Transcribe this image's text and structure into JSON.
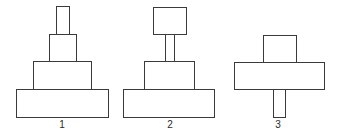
{
  "diagram": {
    "stroke_color": "#3a3a3a",
    "background": "#ffffff",
    "figures": [
      {
        "label": "1",
        "label_pos": {
          "x": 62,
          "y": 120
        },
        "boxes": [
          {
            "name": "top-narrow-block",
            "x": 56,
            "y": 6,
            "w": 14,
            "h": 29
          },
          {
            "name": "second-block",
            "x": 49,
            "y": 34,
            "w": 28,
            "h": 28
          },
          {
            "name": "third-block",
            "x": 33,
            "y": 61,
            "w": 59,
            "h": 29
          },
          {
            "name": "base-block",
            "x": 16,
            "y": 89,
            "w": 93,
            "h": 29
          }
        ]
      },
      {
        "label": "2",
        "label_pos": {
          "x": 170,
          "y": 120
        },
        "boxes": [
          {
            "name": "top-square-block",
            "x": 153,
            "y": 7,
            "w": 34,
            "h": 28
          },
          {
            "name": "narrow-stem",
            "x": 165,
            "y": 34,
            "w": 10,
            "h": 28
          },
          {
            "name": "middle-block",
            "x": 144,
            "y": 61,
            "w": 51,
            "h": 29
          },
          {
            "name": "base-block",
            "x": 123,
            "y": 89,
            "w": 92,
            "h": 29
          }
        ]
      },
      {
        "label": "3",
        "label_pos": {
          "x": 278,
          "y": 120
        },
        "boxes": [
          {
            "name": "top-square-block",
            "x": 263,
            "y": 35,
            "w": 34,
            "h": 28
          },
          {
            "name": "wide-block",
            "x": 234,
            "y": 62,
            "w": 91,
            "h": 28
          },
          {
            "name": "bottom-stem",
            "x": 273,
            "y": 89,
            "w": 13,
            "h": 29
          }
        ]
      }
    ]
  }
}
